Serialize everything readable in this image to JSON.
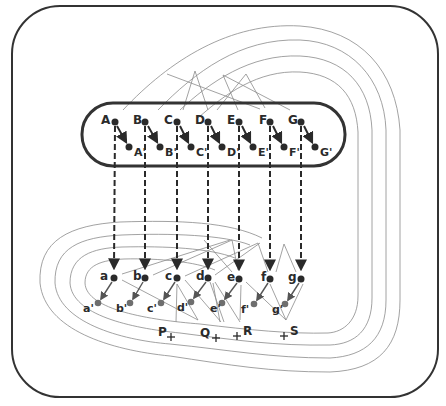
{
  "diagram": {
    "colors": {
      "ink": "#2a2a2a",
      "thin_line": "#8a8a8a",
      "grey_dot": "#6e6e6e",
      "background": "#ffffff"
    },
    "upper_points": [
      {
        "label": "A",
        "x": 115,
        "y": 122
      },
      {
        "label": "B",
        "x": 145,
        "y": 122
      },
      {
        "label": "C",
        "x": 177,
        "y": 122
      },
      {
        "label": "D",
        "x": 208,
        "y": 122
      },
      {
        "label": "E",
        "x": 239,
        "y": 122
      },
      {
        "label": "F",
        "x": 270,
        "y": 122
      },
      {
        "label": "G",
        "x": 301,
        "y": 122
      }
    ],
    "upper_primed_points": [
      {
        "label": "A'",
        "x": 129,
        "y": 147
      },
      {
        "label": "B'",
        "x": 160,
        "y": 147
      },
      {
        "label": "C'",
        "x": 191,
        "y": 147
      },
      {
        "label": "D'",
        "x": 222,
        "y": 147
      },
      {
        "label": "E'",
        "x": 253,
        "y": 147
      },
      {
        "label": "F'",
        "x": 284,
        "y": 147
      },
      {
        "label": "G'",
        "x": 315,
        "y": 147
      }
    ],
    "lower_points": [
      {
        "label": "a",
        "x": 114,
        "y": 278
      },
      {
        "label": "b",
        "x": 145,
        "y": 278
      },
      {
        "label": "c",
        "x": 177,
        "y": 278
      },
      {
        "label": "d",
        "x": 208,
        "y": 278
      },
      {
        "label": "e",
        "x": 239,
        "y": 279
      },
      {
        "label": "f",
        "x": 270,
        "y": 279
      },
      {
        "label": "g",
        "x": 301,
        "y": 279
      }
    ],
    "lower_primed_points": [
      {
        "label": "a'",
        "x": 98,
        "y": 303
      },
      {
        "label": "b'",
        "x": 130,
        "y": 303
      },
      {
        "label": "c'",
        "x": 161,
        "y": 303
      },
      {
        "label": "d'",
        "x": 191,
        "y": 302
      },
      {
        "label": "e'",
        "x": 222,
        "y": 303
      },
      {
        "label": "f'",
        "x": 254,
        "y": 304
      },
      {
        "label": "g'",
        "x": 285,
        "y": 304
      }
    ],
    "crossings": [
      {
        "label": "P",
        "x": 171,
        "y": 337
      },
      {
        "label": "Q",
        "x": 216,
        "y": 338
      },
      {
        "label": "R",
        "x": 237,
        "y": 336
      },
      {
        "label": "S",
        "x": 284,
        "y": 336
      }
    ]
  }
}
